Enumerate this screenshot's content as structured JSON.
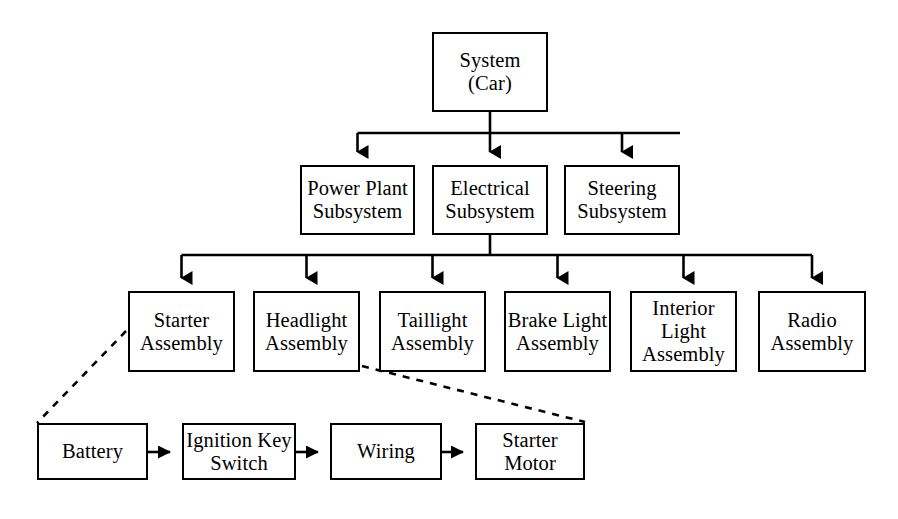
{
  "diagram": {
    "canvas": {
      "width": 898,
      "height": 519,
      "background": "#ffffff"
    },
    "line_color": "#000000",
    "levels": [
      {
        "name": "system",
        "nodes": [
          {
            "id": "system-car",
            "label": "System\n(Car)",
            "x": 432,
            "y": 32,
            "w": 116,
            "h": 80
          }
        ]
      },
      {
        "name": "subsystems",
        "nodes": [
          {
            "id": "power-plant-subsystem",
            "label": "Power Plant\nSubsystem",
            "x": 300,
            "y": 165,
            "w": 115,
            "h": 70
          },
          {
            "id": "electrical-subsystem",
            "label": "Electrical\nSubsystem",
            "x": 432,
            "y": 165,
            "w": 116,
            "h": 70
          },
          {
            "id": "steering-subsystem",
            "label": "Steering\nSubsystem",
            "x": 564,
            "y": 165,
            "w": 116,
            "h": 70
          }
        ]
      },
      {
        "name": "assemblies",
        "nodes": [
          {
            "id": "starter-assembly",
            "label": "Starter\nAssembly",
            "x": 128,
            "y": 291,
            "w": 107,
            "h": 81
          },
          {
            "id": "headlight-assembly",
            "label": "Headlight\nAssembly",
            "x": 253,
            "y": 291,
            "w": 107,
            "h": 81
          },
          {
            "id": "taillight-assembly",
            "label": "Taillight\nAssembly",
            "x": 379,
            "y": 291,
            "w": 107,
            "h": 81
          },
          {
            "id": "brake-light-assembly",
            "label": "Brake Light\nAssembly",
            "x": 504,
            "y": 291,
            "w": 107,
            "h": 81
          },
          {
            "id": "interior-light-assembly",
            "label": "Interior\nLight\nAssembly",
            "x": 630,
            "y": 291,
            "w": 107,
            "h": 81
          },
          {
            "id": "radio-assembly",
            "label": "Radio\nAssembly",
            "x": 758,
            "y": 291,
            "w": 108,
            "h": 81
          }
        ]
      },
      {
        "name": "components",
        "nodes": [
          {
            "id": "battery",
            "label": "Battery",
            "x": 37,
            "y": 423,
            "w": 111,
            "h": 57
          },
          {
            "id": "ignition-key-switch",
            "label": "Ignition Key\nSwitch",
            "x": 182,
            "y": 423,
            "w": 114,
            "h": 57
          },
          {
            "id": "wiring",
            "label": "Wiring",
            "x": 330,
            "y": 423,
            "w": 112,
            "h": 57
          },
          {
            "id": "starter-motor",
            "label": "Starter\nMotor",
            "x": 475,
            "y": 423,
            "w": 110,
            "h": 57
          }
        ]
      }
    ],
    "connections": {
      "system_to_subsystems": {
        "from": "system-car",
        "to": [
          "power-plant-subsystem",
          "electrical-subsystem",
          "steering-subsystem"
        ],
        "style": "solid-arrow"
      },
      "electrical_to_assemblies": {
        "from": "electrical-subsystem",
        "to": [
          "starter-assembly",
          "headlight-assembly",
          "taillight-assembly",
          "brake-light-assembly",
          "interior-light-assembly",
          "radio-assembly"
        ],
        "style": "solid-arrow"
      },
      "component_chain": {
        "sequence": [
          "battery",
          "ignition-key-switch",
          "wiring",
          "starter-motor"
        ],
        "style": "solid-arrow"
      },
      "expansion_callout": {
        "from": "starter-assembly",
        "to": "component-row",
        "style": "dashed"
      }
    }
  }
}
